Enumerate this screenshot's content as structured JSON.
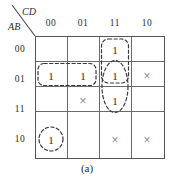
{
  "figure": {
    "caption": "(a)",
    "type": "karnaugh-map",
    "corner": {
      "column_variables": "CD",
      "row_variables": "AB"
    },
    "column_headers": [
      "00",
      "01",
      "11",
      "10"
    ],
    "row_headers": [
      "00",
      "01",
      "11",
      "10"
    ],
    "cells": [
      [
        "",
        "",
        "1",
        ""
      ],
      [
        "1",
        "1",
        "1",
        "×"
      ],
      [
        "",
        "×",
        "1",
        ""
      ],
      [
        "1",
        "",
        "×",
        "×"
      ]
    ],
    "groups": [
      {
        "name": "group-col11-rows00-01",
        "shape": "rounded-rect"
      },
      {
        "name": "group-row01-cols00-01",
        "shape": "rounded-rect"
      },
      {
        "name": "group-col11-rows01-11",
        "shape": "oval"
      },
      {
        "name": "group-row10-col00",
        "shape": "circle"
      }
    ],
    "colors": {
      "grid_line": "#6a6a6a",
      "border": "#555555",
      "one_text": "#2b2b2b",
      "dont_care_text": "#8e8e8e",
      "group_loop": "#3a3a3a",
      "background": "#ffffff"
    }
  }
}
